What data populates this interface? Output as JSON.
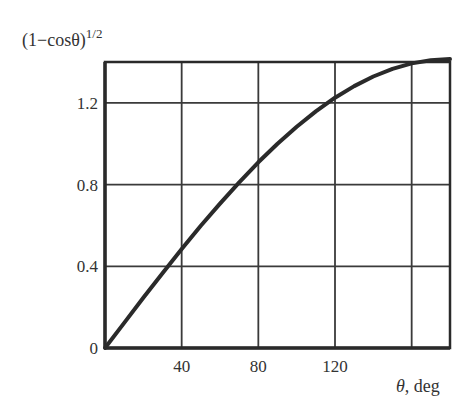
{
  "chart_data": {
    "type": "line",
    "title": "",
    "ylabel": "(1−cosθ)",
    "ylabel_superscript": "1/2",
    "xlabel_symbol": "θ",
    "xlabel_unit": ", deg",
    "xlim": [
      0,
      180
    ],
    "ylim": [
      0,
      1.4
    ],
    "x_ticks": [
      0,
      40,
      80,
      120,
      160
    ],
    "x_tick_labels": [
      "",
      "40",
      "80",
      "120",
      ""
    ],
    "y_ticks": [
      0,
      0.4,
      0.8,
      1.2
    ],
    "y_tick_labels": [
      "0",
      "0.4",
      "0.8",
      "1.2"
    ],
    "grid": true,
    "legend": null,
    "series": [
      {
        "name": "(1-cosθ)^1/2",
        "x": [
          0,
          10,
          20,
          30,
          40,
          50,
          60,
          70,
          80,
          90,
          100,
          110,
          120,
          130,
          140,
          150,
          160,
          170,
          180
        ],
        "values": [
          0,
          0.123,
          0.246,
          0.366,
          0.484,
          0.598,
          0.707,
          0.811,
          0.909,
          1.0,
          1.083,
          1.158,
          1.225,
          1.282,
          1.329,
          1.366,
          1.393,
          1.409,
          1.414
        ]
      }
    ]
  },
  "colors": {
    "line": "#2a2a2a",
    "grid": "#3a3a3a",
    "background": "#ffffff"
  }
}
